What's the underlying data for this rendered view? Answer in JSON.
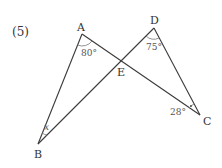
{
  "problem": {
    "number": "(5)"
  },
  "points": {
    "A": {
      "label": "A",
      "x": 82,
      "y": 34
    },
    "B": {
      "label": "B",
      "x": 38,
      "y": 144
    },
    "C": {
      "label": "C",
      "x": 200,
      "y": 115
    },
    "D": {
      "label": "D",
      "x": 154,
      "y": 28
    },
    "E": {
      "label": "E",
      "x": 121,
      "y": 61
    }
  },
  "angles": {
    "A": "80°",
    "D": "75°",
    "C": "28°",
    "B": "x"
  },
  "colors": {
    "line": "#3a3a3a",
    "text": "#333333"
  }
}
